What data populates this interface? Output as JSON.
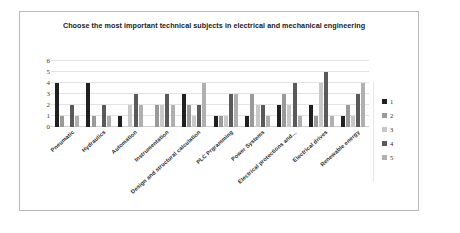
{
  "chart_data": {
    "type": "bar",
    "title": "Choose the most important technical subjects in electrical and mechanical engineering",
    "xlabel": "",
    "ylabel": "",
    "ylim": [
      0,
      6
    ],
    "yticks": [
      6,
      5,
      4,
      3,
      2,
      1,
      0
    ],
    "grid": true,
    "legend_position": "right",
    "categories": [
      "Pneumatic",
      "Hydraulics",
      "Automation",
      "Instrumentation",
      "Design and structural calculation",
      "PLC Prgramming",
      "Power Systems",
      "Electrical protections and…",
      "Electrical drives",
      "Renewable energy"
    ],
    "series": [
      {
        "name": "1",
        "color": "#202020",
        "values": [
          4,
          4,
          1,
          0,
          3,
          1,
          1,
          2,
          2,
          1
        ]
      },
      {
        "name": "2",
        "color": "#9a9a9a",
        "values": [
          1,
          1,
          0,
          2,
          2,
          1,
          3,
          3,
          1,
          2
        ]
      },
      {
        "name": "3",
        "color": "#c8c8c8",
        "values": [
          0,
          0,
          2,
          2,
          1,
          1,
          2,
          2,
          4,
          1
        ]
      },
      {
        "name": "4",
        "color": "#5a5a5a",
        "values": [
          2,
          2,
          3,
          3,
          2,
          3,
          2,
          4,
          5,
          3
        ]
      },
      {
        "name": "5",
        "color": "#b0b0b0",
        "values": [
          1,
          1,
          2,
          2,
          4,
          3,
          1,
          1,
          1,
          4
        ]
      }
    ]
  },
  "legend": {
    "items": [
      {
        "label": "1"
      },
      {
        "label": "2"
      },
      {
        "label": "3"
      },
      {
        "label": "4"
      },
      {
        "label": "5"
      }
    ]
  },
  "colors": {
    "frame_border": "#b9b9b9",
    "gridline": "#e2e2e2",
    "title_text": "#1a1a1a",
    "tick_text": "#3a3a3a",
    "background": "#ffffff"
  }
}
